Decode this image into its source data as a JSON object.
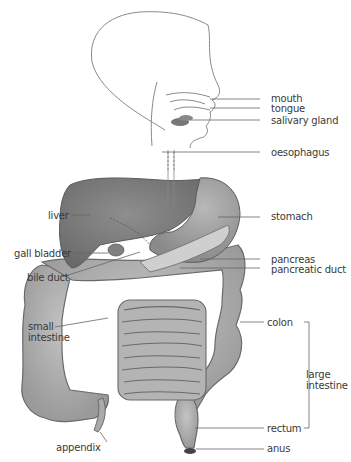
{
  "diagram": {
    "type": "anatomical illustration",
    "colors": {
      "organ_fill": "#a9a9a9",
      "liver_fill": "#7f7f7f",
      "stomach_fill": "#969696",
      "outline": "#5a5a5a",
      "leader_line": "#666666",
      "label_text": "#3a3a3a"
    },
    "labels_right": {
      "mouth": "mouth",
      "tongue": "tongue",
      "salivary_gland": "salivary gland",
      "oesophagus": "oesophagus",
      "stomach": "stomach",
      "pancreas": "pancreas",
      "pancreatic_duct": "pancreatic duct",
      "colon": "colon",
      "large_intestine_line1": "large",
      "large_intestine_line2": "intestine",
      "rectum": "rectum",
      "anus": "anus"
    },
    "labels_left": {
      "liver": "liver",
      "gall_bladder": "gall bladder",
      "bile_duct": "bile duct",
      "small_intestine_line1": "small",
      "small_intestine_line2": "intestine",
      "appendix": "appendix"
    }
  }
}
